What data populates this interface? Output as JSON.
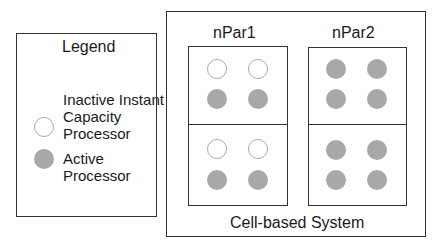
{
  "legend": {
    "title": "Legend",
    "items": [
      {
        "type": "inactive",
        "lines": [
          "Inactive Instant",
          "Capacity",
          "Processor"
        ]
      },
      {
        "type": "active",
        "lines": [
          "Active",
          "Processor"
        ]
      }
    ]
  },
  "system": {
    "label": "Cell-based System",
    "partitions": [
      {
        "name": "nPar1",
        "cells": [
          [
            "inactive",
            "inactive",
            "active",
            "active"
          ],
          [
            "inactive",
            "inactive",
            "active",
            "active"
          ]
        ]
      },
      {
        "name": "nPar2",
        "cells": [
          [
            "active",
            "active",
            "active",
            "active"
          ],
          [
            "active",
            "active",
            "active",
            "active"
          ]
        ]
      }
    ]
  },
  "colors": {
    "active_fill": "#a8a8a8",
    "inactive_stroke": "#aaaaaa",
    "line": "#333333"
  }
}
